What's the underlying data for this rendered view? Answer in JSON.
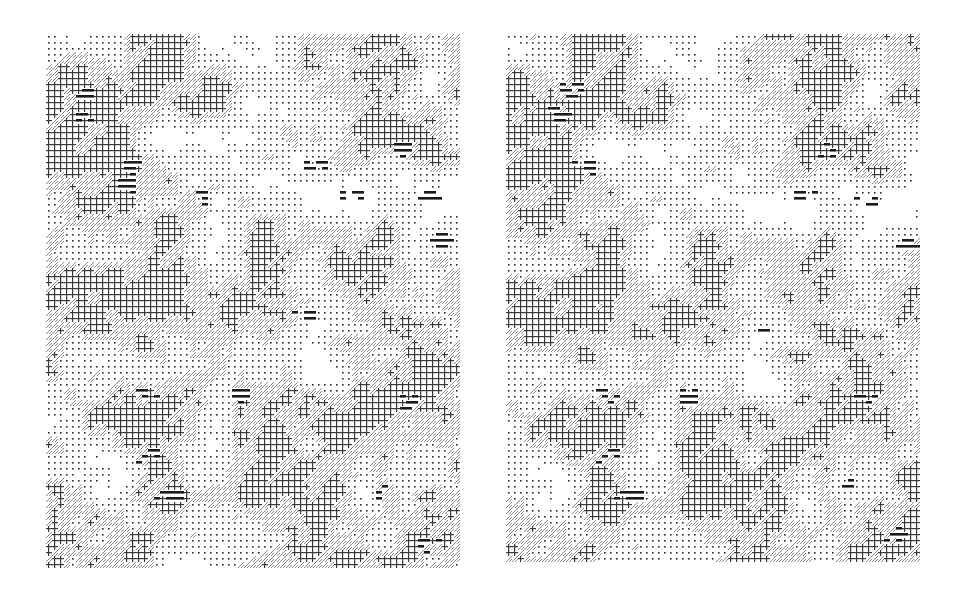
{
  "figure": {
    "cell_size_px": 6,
    "colors": {
      "background": "#ffffff",
      "ink": "#1a1a1a",
      "hatch": "#8a8a8a",
      "grid": "#3a3a3a",
      "dot": "#2a2a2a"
    },
    "pattern_classes": [
      {
        "id": 0,
        "name": "blank",
        "fill": "white"
      },
      {
        "id": 1,
        "name": "dots",
        "fill": "sparse dot"
      },
      {
        "id": 2,
        "name": "diagonal-hatch",
        "fill": "gray diagonal lines"
      },
      {
        "id": 3,
        "name": "grid",
        "fill": "crosshatch grid"
      },
      {
        "id": 4,
        "name": "horizontal-bars",
        "fill": "thick black horizontal bars"
      }
    ],
    "thresholds": [
      0.3,
      0.46,
      0.56,
      0.86
    ],
    "panels": [
      {
        "name": "left-image",
        "seed": 17,
        "offset": [
          0,
          0
        ],
        "hotspots": [
          [
            32,
            55
          ],
          [
            30,
            80
          ],
          [
            82,
            130
          ],
          [
            80,
            148
          ],
          [
            155,
            160
          ],
          [
            355,
            115
          ],
          [
            380,
            160
          ],
          [
            265,
            128
          ],
          [
            305,
            158
          ],
          [
            395,
            205
          ],
          [
            255,
            280
          ],
          [
            95,
            358
          ],
          [
            195,
            358
          ],
          [
            360,
            368
          ],
          [
            100,
            420
          ],
          [
            120,
            458
          ],
          [
            330,
            455
          ],
          [
            380,
            508
          ],
          [
            250,
            540
          ]
        ]
      },
      {
        "name": "right-image",
        "seed": 17,
        "offset": [
          3,
          -2
        ],
        "hotspots": [
          [
            62,
            52
          ],
          [
            52,
            77
          ],
          [
            78,
            130
          ],
          [
            318,
            115
          ],
          [
            296,
            160
          ],
          [
            356,
            165
          ],
          [
            395,
            210
          ],
          [
            250,
            290
          ],
          [
            95,
            360
          ],
          [
            180,
            360
          ],
          [
            360,
            360
          ],
          [
            100,
            420
          ],
          [
            120,
            458
          ],
          [
            340,
            450
          ],
          [
            390,
            500
          ],
          [
            250,
            535
          ]
        ]
      }
    ]
  }
}
